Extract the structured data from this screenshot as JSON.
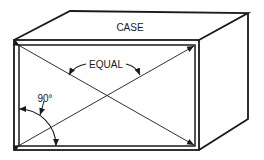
{
  "diagram": {
    "title": "CASE",
    "labels": {
      "case": "CASE",
      "equal": "EQUAL",
      "angle": "90°"
    },
    "colors": {
      "line": "#1a1a1a",
      "background": "#ffffff"
    }
  }
}
